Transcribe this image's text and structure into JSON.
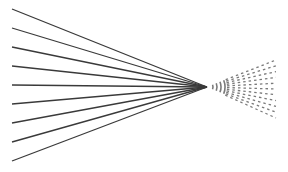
{
  "diagram": {
    "background": "#ffffff",
    "line_color": "#3a3a3a",
    "dash_color": "#7a7a7a",
    "focus_point": {
      "x": 207,
      "y": 87
    },
    "converging_lines": {
      "count": 9,
      "start_x": 12,
      "start_ys": [
        9,
        28,
        47,
        66,
        85,
        104,
        123,
        142,
        161
      ],
      "stroke_width": 1.3
    },
    "diverging_rays": {
      "count": 11,
      "end_x": 276,
      "end_y_top": 60,
      "end_y_bottom": 118,
      "dash": "2.5 3",
      "stroke_width": 1.3
    },
    "arcs": {
      "radii": [
        6,
        10,
        14,
        18
      ],
      "half_angle_deg": 22
    }
  }
}
